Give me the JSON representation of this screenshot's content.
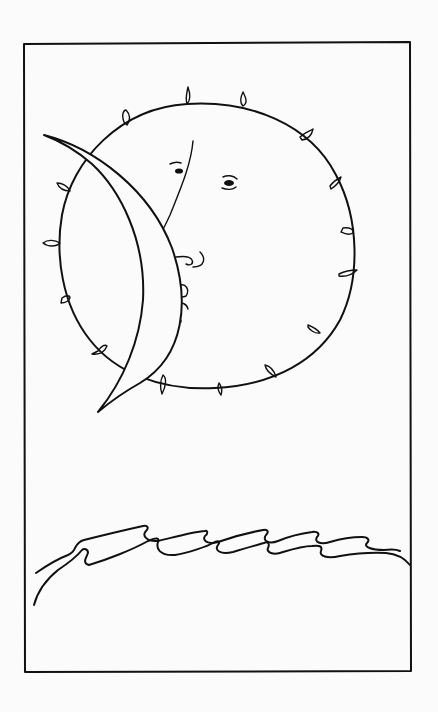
{
  "artwork": {
    "type": "ink line drawing",
    "background_color": "#fbfbfb",
    "ink_color": "#111111",
    "elements": {
      "frame": "rectangular border frame",
      "sun": "round sun with face and small flame-like rays",
      "moon": "crescent moon overlapping left side of sun",
      "waves": "stylized curling ocean waves"
    }
  }
}
